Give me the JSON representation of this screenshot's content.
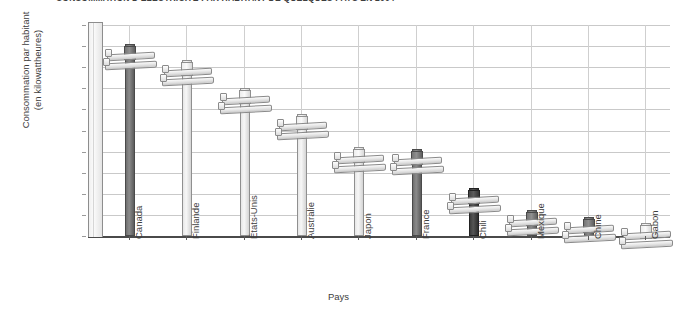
{
  "chart_data": {
    "type": "bar",
    "title": "CONSOMMATION D'ÉLECTRICITÉ PAR HABITANT DE QUELQUES PAYS EN 2004",
    "xlabel": "Pays",
    "ylabel": "Consommation par habitant\n(en kilowattheures)",
    "categories": [
      "Canada",
      "Finlande",
      "États-Unis",
      "Australie",
      "Japon",
      "France",
      "Chili",
      "Mexique",
      "Chine",
      "Gabon"
    ],
    "values": [
      18000,
      16500,
      13800,
      11400,
      8200,
      8100,
      4400,
      2300,
      1600,
      1000
    ],
    "ylim": [
      0,
      20000
    ],
    "ytick_values": [
      0,
      2000,
      4000,
      6000,
      8000,
      10000,
      12000,
      14000,
      16000,
      18000,
      20000
    ],
    "ytick_labels": [
      "0",
      "2 000",
      "4 000",
      "6 000",
      "8 000",
      "10 000",
      "12 000",
      "14 000",
      "16 000",
      "18 000",
      "20 000"
    ],
    "grid": true,
    "legend": null,
    "bar_style": "utility-pole",
    "bar_shades": [
      "dark",
      "light",
      "light",
      "light",
      "light",
      "dark",
      "darkest",
      "dark",
      "dark",
      "light"
    ],
    "colors": {
      "pole_dark": "#6e6e6e",
      "pole_light": "#e6e6e6",
      "pole_darkest": "#3c3c3c",
      "gridline": "#c9c9c9",
      "axis": "#4a4a4a",
      "text": "#3d3d3d"
    }
  }
}
